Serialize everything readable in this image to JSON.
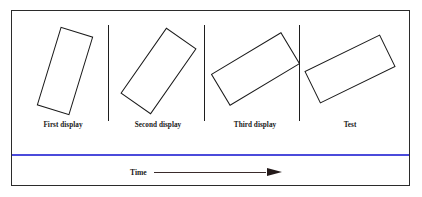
{
  "figure": {
    "border_color": "#2b2b2b",
    "background": "#ffffff"
  },
  "panels": [
    {
      "label": "First display",
      "left": 13,
      "shape": {
        "name": "rotated-rectangle",
        "width": 34,
        "height": 82,
        "rotation_deg": 17,
        "stroke": "#1a1a1a",
        "fill": "#ffffff",
        "offset_x": 2,
        "offset_y": 0
      }
    },
    {
      "label": "Second display",
      "left": 108,
      "shape": {
        "name": "rotated-rectangle",
        "width": 37,
        "height": 80,
        "rotation_deg": 35,
        "stroke": "#1a1a1a",
        "fill": "#ffffff",
        "offset_x": 0,
        "offset_y": 0
      }
    },
    {
      "label": "Third display",
      "left": 205,
      "shape": {
        "name": "rotated-rectangle",
        "width": 37,
        "height": 82,
        "rotation_deg": 59,
        "stroke": "#1a1a1a",
        "fill": "#ffffff",
        "offset_x": 0,
        "offset_y": -2
      }
    },
    {
      "label": "Test",
      "left": 300,
      "shape": {
        "name": "rotated-rectangle",
        "width": 36,
        "height": 84,
        "rotation_deg": 64,
        "stroke": "#1a1a1a",
        "fill": "#ffffff",
        "offset_x": 0,
        "offset_y": -2
      }
    }
  ],
  "dividers": [
    {
      "left": 108
    },
    {
      "left": 204
    },
    {
      "left": 299
    }
  ],
  "separator": {
    "name": "blue-horizontal-rule",
    "color": "#4b4bdb"
  },
  "time_axis": {
    "label": "Time",
    "arrow_direction": "right",
    "line_color": "#3a2b2b",
    "head_color": "#241a1a"
  }
}
